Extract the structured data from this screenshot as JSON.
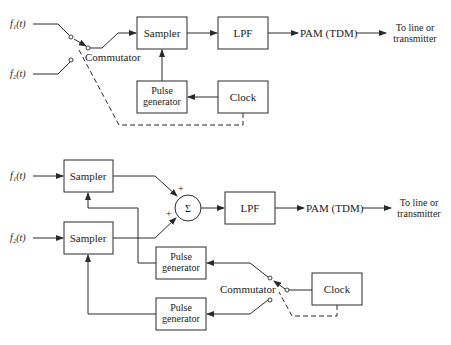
{
  "diagram_top": {
    "title": "PAM TDM system with single sampler",
    "inputs": [
      "f₁(t)",
      "f₂(t)"
    ],
    "commutator_label": "Commutator",
    "blocks": {
      "sampler": "Sampler",
      "lpf": "LPF",
      "pulse_generator_line1": "Pulse",
      "pulse_generator_line2": "generator",
      "clock": "Clock"
    },
    "output_label": "PAM (TDM)",
    "destination_line1": "To line or",
    "destination_line2": "transmitter"
  },
  "diagram_bottom": {
    "title": "PAM TDM system with separate samplers",
    "inputs": [
      "f₁(t)",
      "f₂(t)"
    ],
    "blocks": {
      "sampler_1": "Sampler",
      "sampler_2": "Sampler",
      "summer_symbol": "Σ",
      "summer_plus_1": "+",
      "summer_plus_2": "+",
      "lpf": "LPF",
      "pulse_generator_1_line1": "Pulse",
      "pulse_generator_1_line2": "generator",
      "pulse_generator_2_line1": "Pulse",
      "pulse_generator_2_line2": "generator",
      "clock": "Clock"
    },
    "commutator_label": "Commutator",
    "output_label": "PAM (TDM)",
    "destination_line1": "To line or",
    "destination_line2": "transmitter"
  }
}
